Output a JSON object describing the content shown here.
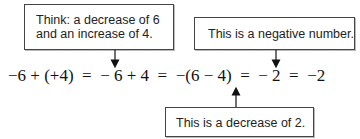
{
  "callouts": {
    "top_left": {
      "line1": "Think: a decrease of 6",
      "line2": "and an increase of 4."
    },
    "top_right": {
      "text": "This is a negative number."
    },
    "bottom": {
      "text": "This is a decrease of 2."
    }
  },
  "equation": {
    "text": "−6 + (+4)  =  − 6 + 4  =  −(6 − 4)  =  − 2  =  −2"
  },
  "arrows": [
    {
      "from": "top_left",
      "direction": "down",
      "points_to": "+ in −6 + 4"
    },
    {
      "from": "top_right",
      "direction": "down",
      "points_to": "final −2"
    },
    {
      "from": "bottom",
      "direction": "up",
      "points_to": "− 2 (minus sign)"
    }
  ]
}
